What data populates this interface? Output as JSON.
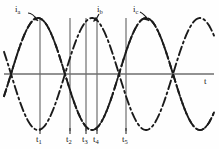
{
  "figure": {
    "kind": "waveform-diagram",
    "background": "#fefefe",
    "ink_color": "#1b1b1b",
    "gridline_color": "#6e6e6e"
  },
  "axes": {
    "time_axis_label": "t",
    "baseline_y": 74,
    "x_start": 4,
    "x_end": 214
  },
  "curve_labels": [
    {
      "text": "i",
      "sub": "a",
      "x": 16,
      "y": 9
    },
    {
      "text": "i",
      "sub": "b",
      "x": 96,
      "y": 9
    },
    {
      "text": "i",
      "sub": "c",
      "x": 134,
      "y": 9
    }
  ],
  "time_markers": [
    {
      "label": "t",
      "sub": "1",
      "x": 40
    },
    {
      "label": "t",
      "sub": "2",
      "x": 70
    },
    {
      "label": "t",
      "sub": "3",
      "x": 86
    },
    {
      "label": "t",
      "sub": "4",
      "x": 97
    },
    {
      "label": "t",
      "sub": "5",
      "x": 126
    }
  ],
  "chart_data": {
    "type": "line",
    "title": "",
    "xlabel": "t",
    "ylabel": "",
    "grid": false,
    "legend_position": "inline-annotations",
    "xlim": [
      0,
      219
    ],
    "ylim": [
      -1.15,
      1.15
    ],
    "amplitude_px": 56,
    "period_px": 108,
    "baseline_y_px": 74,
    "series": [
      {
        "name": "i_a",
        "dash": "dash-dot",
        "phase_deg": 0,
        "peak_x_px": 38,
        "label": "i",
        "sub": "a"
      },
      {
        "name": "i_b",
        "dash": "dash-dot-long",
        "phase_deg": -120,
        "peak_x_px": 92,
        "label": "i",
        "sub": "b"
      },
      {
        "name": "i_c",
        "dash": "dashed",
        "phase_deg": -240,
        "peak_x_px": 146,
        "label": "i",
        "sub": "c"
      }
    ],
    "annotations": [
      {
        "text": "i_a",
        "type": "curve-callout-arrow"
      },
      {
        "text": "i_b",
        "type": "curve-callout-arrow"
      },
      {
        "text": "i_c",
        "type": "curve-callout-arrow"
      },
      {
        "text": "t1",
        "type": "vertical-time-marker"
      },
      {
        "text": "t2",
        "type": "vertical-time-marker"
      },
      {
        "text": "t3",
        "type": "vertical-time-marker"
      },
      {
        "text": "t4",
        "type": "vertical-time-marker"
      },
      {
        "text": "t5",
        "type": "vertical-time-marker"
      }
    ]
  }
}
